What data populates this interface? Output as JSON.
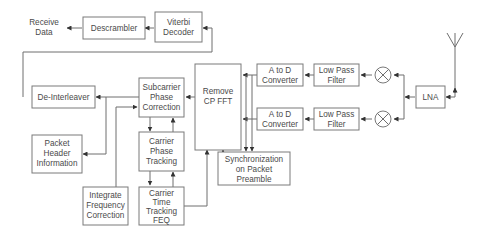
{
  "diagram": {
    "colors": {
      "box_stroke": "#7a7a7a",
      "line": "#6e6e6e",
      "text": "#4a4a4a",
      "background": "#ffffff"
    },
    "labels": {
      "receive_data": [
        "Receive",
        "Data"
      ],
      "descrambler": [
        "Descrambler"
      ],
      "viterbi": [
        "Viterbi",
        "Decoder"
      ],
      "deinterleaver": [
        "De-Interleaver"
      ],
      "subcarrier": [
        "Subcarrier",
        "Phase",
        "Correction"
      ],
      "remove_cp": [
        "Remove",
        "CP FFT"
      ],
      "adc_top": [
        "A to D",
        "Converter"
      ],
      "adc_bottom": [
        "A to D",
        "Converter"
      ],
      "lpf_top": [
        "Low Pass",
        "Filter"
      ],
      "lpf_bottom": [
        "Low Pass",
        "Filter"
      ],
      "lna": [
        "LNA"
      ],
      "packet_header": [
        "Packet",
        "Header",
        "Information"
      ],
      "carrier_phase": [
        "Carrier",
        "Phase",
        "Tracking"
      ],
      "sync": [
        "Synchronization",
        "on Packet",
        "Preamble"
      ],
      "integrate_freq": [
        "Integrate",
        "Frequency",
        "Correction"
      ],
      "carrier_time": [
        "Carrier",
        "Time",
        "Tracking",
        "FEQ"
      ]
    },
    "icons": {
      "mixer_top": "mixer-icon",
      "mixer_bottom": "mixer-icon",
      "antenna": "antenna-icon"
    }
  }
}
